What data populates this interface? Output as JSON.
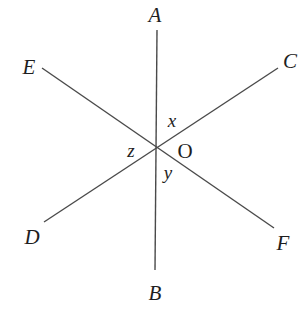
{
  "diagram": {
    "type": "intersecting-lines",
    "center": {
      "label": "O",
      "x": 157,
      "y": 147
    },
    "lines": [
      {
        "name": "AB",
        "from": "A",
        "to": "B",
        "x1": 157,
        "y1": 30,
        "x2": 155,
        "y2": 270
      },
      {
        "name": "EF",
        "from": "E",
        "to": "F",
        "x1": 42,
        "y1": 68,
        "x2": 274,
        "y2": 228
      },
      {
        "name": "CD",
        "from": "C",
        "to": "D",
        "x1": 278,
        "y1": 68,
        "x2": 44,
        "y2": 222
      }
    ],
    "points": {
      "A": {
        "label": "A",
        "x": 155,
        "y": 22
      },
      "B": {
        "label": "B",
        "x": 155,
        "y": 300
      },
      "C": {
        "label": "C",
        "x": 290,
        "y": 68
      },
      "D": {
        "label": "D",
        "x": 30,
        "y": 244
      },
      "E": {
        "label": "E",
        "x": 28,
        "y": 74
      },
      "F": {
        "label": "F",
        "x": 284,
        "y": 250
      }
    },
    "angles": {
      "x": {
        "label": "x",
        "x": 172,
        "y": 126
      },
      "y": {
        "label": "y",
        "x": 168,
        "y": 179
      },
      "z": {
        "label": "z",
        "x": 130,
        "y": 157
      }
    }
  }
}
